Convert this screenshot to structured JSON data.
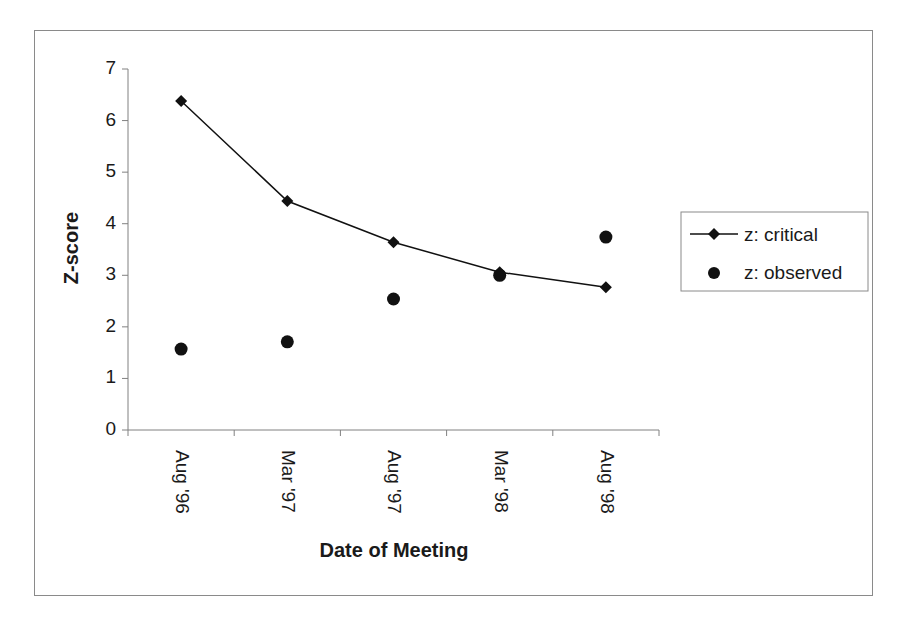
{
  "chart_data": {
    "type": "line",
    "title": "",
    "xlabel": "Date of Meeting",
    "ylabel": "Z-score",
    "categories": [
      "Aug '96",
      "Mar '97",
      "Aug '97",
      "Mar '98",
      "Aug '98"
    ],
    "series": [
      {
        "name": "z: critical",
        "style": "line-with-diamond-markers",
        "values": [
          6.38,
          4.44,
          3.64,
          3.06,
          2.77
        ]
      },
      {
        "name": "z: observed",
        "style": "circle-markers-only",
        "values": [
          1.57,
          1.71,
          2.54,
          3.0,
          3.74
        ]
      }
    ],
    "ylim": [
      0,
      7
    ],
    "yticks": [
      0,
      1,
      2,
      3,
      4,
      5,
      6,
      7
    ],
    "grid": false,
    "legend_position": "right"
  },
  "axes": {
    "y_title": "Z-score",
    "x_title": "Date of Meeting",
    "y_ticks": [
      "0",
      "1",
      "2",
      "3",
      "4",
      "5",
      "6",
      "7"
    ],
    "x_ticks": [
      "Aug '96",
      "Mar '97",
      "Aug '97",
      "Mar '98",
      "Aug '98"
    ]
  },
  "legend": {
    "items": [
      {
        "label": "z: critical",
        "marker": "diamond-line"
      },
      {
        "label": "z: observed",
        "marker": "circle"
      }
    ]
  },
  "colors": {
    "series": "#111111",
    "axis": "#808080",
    "frame": "#8a8a8a"
  }
}
